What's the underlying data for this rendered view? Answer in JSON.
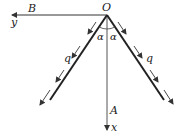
{
  "diagram": {
    "type": "physics-force-diagram",
    "labels": {
      "origin": "O",
      "point_b": "B",
      "point_a": "A",
      "axis_y": "y",
      "axis_x": "x",
      "load_left": "q",
      "load_right": "q",
      "angle_left": "α",
      "angle_right": "α"
    },
    "colors": {
      "line": "#333333",
      "background": "#ffffff"
    }
  }
}
